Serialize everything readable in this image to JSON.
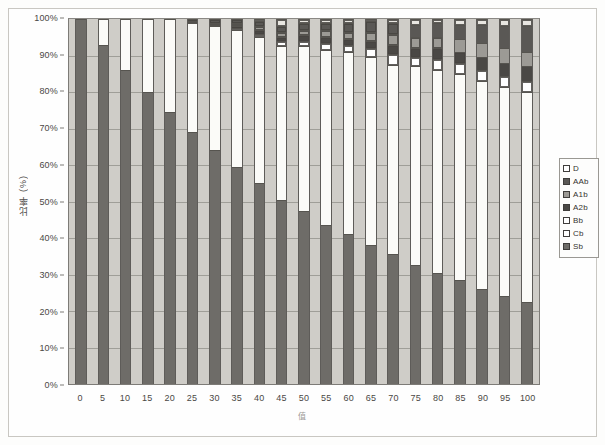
{
  "figure": {
    "title": "",
    "y_axis_title": "比率 (%)",
    "x_axis_title": "值"
  },
  "legend": {
    "position": "right",
    "entries": [
      {
        "label": "D",
        "color": "#ffffff"
      },
      {
        "label": "AAb",
        "color": "#5a5855"
      },
      {
        "label": "A1b",
        "color": "#9c9a95"
      },
      {
        "label": "A2b",
        "color": "#4a4845"
      },
      {
        "label": "Bb",
        "color": "#ffffff"
      },
      {
        "label": "Cb",
        "color": "#ffffff"
      },
      {
        "label": "Sb",
        "color": "#6e6c68"
      }
    ]
  },
  "chart_data": {
    "type": "bar",
    "subtype": "100% stacked bar",
    "title": "",
    "xlabel": "值",
    "ylabel": "比率 (%)",
    "ylim": [
      0,
      100
    ],
    "ytick_labels": [
      "0%",
      "10%",
      "20%",
      "30%",
      "40%",
      "50%",
      "60%",
      "70%",
      "80%",
      "90%",
      "100%"
    ],
    "ytick_values": [
      0,
      10,
      20,
      30,
      40,
      50,
      60,
      70,
      80,
      90,
      100
    ],
    "grid": true,
    "categories": [
      0,
      5,
      10,
      15,
      20,
      25,
      30,
      35,
      40,
      45,
      50,
      55,
      60,
      65,
      70,
      75,
      80,
      85,
      90,
      95,
      100
    ],
    "series": [
      {
        "name": "Sb",
        "color": "#6e6c68",
        "values": [
          100,
          93,
          86,
          80,
          74.5,
          69,
          64,
          59.5,
          55,
          51,
          47.5,
          43.5,
          41,
          38,
          35.5,
          32.5,
          30.5,
          28.5,
          26,
          24,
          22.5
        ]
      },
      {
        "name": "Cb",
        "color": "#fbfbf8",
        "values": [
          0,
          7,
          14,
          20,
          25.5,
          30,
          34,
          37.5,
          40,
          42.5,
          45,
          48,
          50,
          51.5,
          52,
          54.5,
          55.5,
          56.5,
          57,
          57.5,
          57.5
        ]
      },
      {
        "name": "Bb",
        "color": "#ffffff",
        "values": [
          0,
          0,
          0,
          0,
          0,
          0,
          0,
          0.5,
          1,
          1.5,
          1.5,
          2,
          2,
          2.5,
          3,
          2.5,
          3,
          3,
          3,
          3,
          3
        ]
      },
      {
        "name": "A2b",
        "color": "#4a4845",
        "values": [
          0,
          0,
          0,
          0,
          0,
          0,
          0.5,
          0.5,
          1,
          1,
          1.5,
          1.5,
          1.5,
          2,
          2.5,
          2.5,
          3,
          3,
          3.5,
          3.5,
          4
        ]
      },
      {
        "name": "A1b",
        "color": "#9c9a95",
        "values": [
          0,
          0,
          0,
          0,
          0,
          0.5,
          0.5,
          1,
          1,
          1.5,
          1.5,
          2,
          2,
          2.5,
          3,
          3,
          3,
          3.5,
          4,
          4,
          4
        ]
      },
      {
        "name": "AAb",
        "color": "#5a5855",
        "values": [
          0,
          0,
          0,
          0,
          0,
          0.5,
          1,
          1,
          1.5,
          1.5,
          2,
          2,
          2.5,
          3,
          3,
          3.5,
          4,
          4,
          5,
          6,
          7
        ]
      },
      {
        "name": "D",
        "color": "#e8e6e1",
        "values": [
          0,
          0,
          0,
          0,
          0,
          0,
          0,
          0,
          0.5,
          2,
          1,
          1,
          1,
          0.5,
          1,
          1.5,
          1,
          1.5,
          1.5,
          2,
          2
        ]
      }
    ]
  }
}
